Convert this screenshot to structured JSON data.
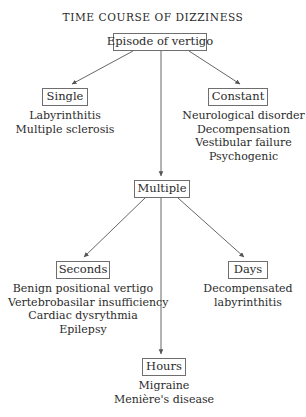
{
  "title": "TIME COURSE OF DIZZINESS",
  "colors": {
    "background": "#ffffff",
    "text": "#2b2b2b",
    "box_border": "#6e6e6e",
    "edge": "#555555"
  },
  "nodes": {
    "root": {
      "label": "Episode of vertigo"
    },
    "single": {
      "label": "Single"
    },
    "constant": {
      "label": "Constant"
    },
    "multiple": {
      "label": "Multiple"
    },
    "seconds": {
      "label": "Seconds"
    },
    "days": {
      "label": "Days"
    },
    "hours": {
      "label": "Hours"
    }
  },
  "lists": {
    "single_causes": [
      "Labyrinthitis",
      "Multiple sclerosis"
    ],
    "constant_causes": [
      "Neurological disorder",
      "Decompensation",
      "Vestibular failure",
      "Psychogenic"
    ],
    "seconds_causes": [
      "Benign positional vertigo",
      "Vertebrobasilar insufficiency",
      "Cardiac dysrythmia",
      "Epilepsy"
    ],
    "days_causes": [
      "Decompensated",
      "labyrinthitis"
    ],
    "hours_causes": [
      "Migraine",
      "Menière's disease"
    ]
  },
  "edges": [
    {
      "from": "root",
      "to": "single"
    },
    {
      "from": "root",
      "to": "multiple"
    },
    {
      "from": "root",
      "to": "constant"
    },
    {
      "from": "multiple",
      "to": "seconds"
    },
    {
      "from": "multiple",
      "to": "hours"
    },
    {
      "from": "multiple",
      "to": "days"
    }
  ]
}
